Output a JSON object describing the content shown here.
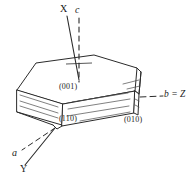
{
  "figure": {
    "kind": "crystal-orientation-diagram",
    "background_color": "#ffffff",
    "ink_color": "#1a1a1a"
  },
  "axes": {
    "x": {
      "label": "X",
      "style": "solid",
      "position": "top"
    },
    "c": {
      "label": "c",
      "style": "dashed",
      "position": "top"
    },
    "b_z": {
      "label": "b = Z",
      "style": "dashed-leader",
      "position": "right"
    },
    "a": {
      "label": "a",
      "style": "dashed",
      "position": "bottom-left"
    },
    "y": {
      "label": "Y",
      "style": "solid",
      "position": "bottom"
    }
  },
  "faces": [
    {
      "id": "face-001",
      "label": "(001)",
      "name": "basal-pinacoid"
    },
    {
      "id": "face-110",
      "label": "(110)",
      "name": "prism-front-left"
    },
    {
      "id": "face-010",
      "label": "(010)",
      "name": "side-pinacoid"
    }
  ],
  "labels": {
    "x_axis": "X",
    "c_axis": "c",
    "b_z_axis": "b = Z",
    "a_axis": "a",
    "y_axis": "Y",
    "face_001": "(001)",
    "face_110": "(110)",
    "face_010": "(010)"
  },
  "colors": {
    "ink": "#1a1a1a",
    "stroke": "#2b2b2b",
    "background": "#ffffff"
  }
}
